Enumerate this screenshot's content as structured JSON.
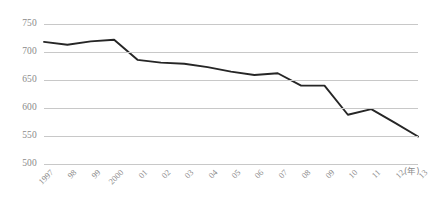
{
  "chart_data": {
    "type": "line",
    "title": "",
    "subtitle": "",
    "xlabel": "(年)",
    "ylabel": "",
    "grid": true,
    "legend": false,
    "legend_position": "none",
    "xlim": [
      1997,
      2013
    ],
    "ylim": [
      500,
      750
    ],
    "y_ticks": [
      750,
      700,
      650,
      600,
      550,
      500
    ],
    "y_tick_labels": [
      "750",
      "700",
      "650",
      "600",
      "550",
      "500"
    ],
    "categories": [
      "1997",
      "98",
      "99",
      "2000",
      "01",
      "02",
      "03",
      "04",
      "05",
      "06",
      "07",
      "08",
      "09",
      "10",
      "11",
      "12",
      "13"
    ],
    "x": [
      1997,
      1998,
      1999,
      2000,
      2001,
      2002,
      2003,
      2004,
      2005,
      2006,
      2007,
      2008,
      2009,
      2010,
      2011,
      2012,
      2013
    ],
    "values": [
      718,
      713,
      719,
      722,
      686,
      681,
      679,
      673,
      665,
      659,
      662,
      640,
      640,
      588,
      598,
      574,
      549
    ],
    "series": [
      {
        "name": "series-1",
        "values": [
          718,
          713,
          719,
          722,
          686,
          681,
          679,
          673,
          665,
          659,
          662,
          640,
          640,
          588,
          598,
          574,
          549
        ]
      }
    ],
    "annotations": []
  },
  "style": {
    "line_color": "#262626",
    "gridline_color": "#c8c8c8",
    "label_color": "#8a8a8a",
    "background_color": "#ffffff"
  }
}
